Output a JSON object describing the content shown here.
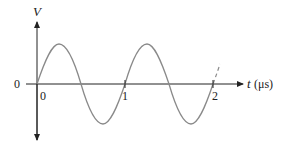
{
  "diagram": {
    "type": "sine-wave-plot",
    "y_axis": {
      "label": "V",
      "origin_label": "0"
    },
    "x_axis": {
      "label_var": "t",
      "label_unit": "(μs)",
      "ticks": [
        "0",
        "1",
        "2"
      ]
    },
    "waveform": {
      "shape": "sine",
      "period": "1 μs",
      "cycles_shown": 2,
      "continuation": "dashed"
    },
    "colors": {
      "axis": "#222222",
      "curve": "#8a8a8a"
    }
  }
}
